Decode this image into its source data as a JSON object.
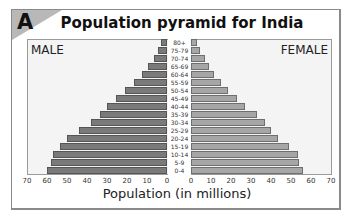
{
  "figure": {
    "tag": "A",
    "title": "Population pyramid for India",
    "male_label": "MALE",
    "female_label": "FEMALE",
    "xlabel": "Population (in millions)"
  },
  "colors": {
    "male_bar": "#7a7a7a",
    "female_bar": "#a6a6a6",
    "panel_bg": "#f4f4f4",
    "corner": "#b8b8b8"
  },
  "chart_data": {
    "type": "bar",
    "orientation": "horizontal-pyramid",
    "title": "Population pyramid for India",
    "xlabel": "Population (in millions)",
    "ylabel": "",
    "categories": [
      "80+",
      "75-79",
      "70-74",
      "65-69",
      "60-64",
      "55-59",
      "50-54",
      "45-49",
      "40-44",
      "35-39",
      "30-34",
      "25-29",
      "20-24",
      "15-19",
      "10-14",
      "5-9",
      "0-4"
    ],
    "series": [
      {
        "name": "MALE",
        "values": [
          3,
          4.5,
          6.5,
          9.5,
          12.5,
          16.5,
          21,
          25.5,
          30,
          33.5,
          38,
          44,
          50,
          53.5,
          57,
          58,
          60
        ]
      },
      {
        "name": "FEMALE",
        "values": [
          3,
          4.5,
          7,
          9,
          11.5,
          15,
          18.5,
          23,
          27,
          33,
          37,
          40,
          43.5,
          49,
          53.5,
          54,
          56
        ]
      }
    ],
    "x_ticks_male": [
      "70",
      "60",
      "50",
      "40",
      "30",
      "20",
      "10",
      "0"
    ],
    "x_ticks_female": [
      "0",
      "10",
      "20",
      "30",
      "40",
      "50",
      "60",
      "70"
    ],
    "xlim": [
      0,
      70
    ],
    "grid": false,
    "legend": "side labels MALE (left) and FEMALE (right)"
  }
}
